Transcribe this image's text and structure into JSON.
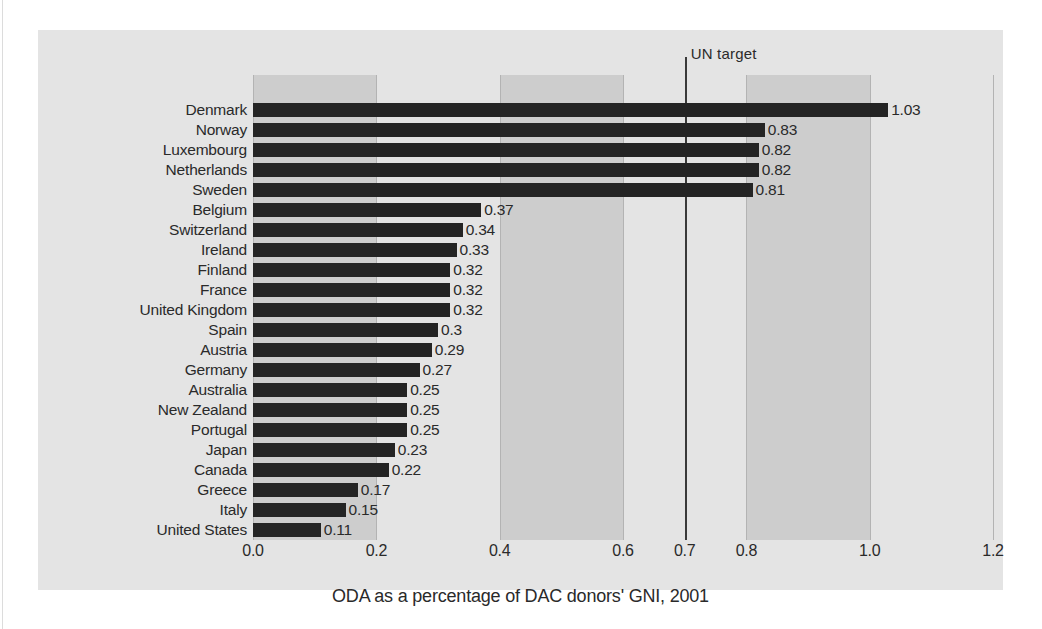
{
  "chart_data": {
    "type": "bar",
    "orientation": "horizontal",
    "title": "",
    "caption": "ODA as a percentage of DAC donors' GNI, 2001",
    "xlabel": "",
    "ylabel": "",
    "xlim": [
      0.0,
      1.2
    ],
    "xticks": [
      "0.0",
      "0.2",
      "0.4",
      "0.6",
      "0.7",
      "0.8",
      "1.0",
      "1.2"
    ],
    "xtick_values": [
      0.0,
      0.2,
      0.4,
      0.6,
      0.7,
      0.8,
      1.0,
      1.2
    ],
    "grid": "vertical-banded",
    "legend": "none",
    "shaded_bands": [
      [
        0.0,
        0.2
      ],
      [
        0.4,
        0.6
      ],
      [
        0.8,
        1.0
      ]
    ],
    "annotation": {
      "label": "UN target",
      "value": 0.7
    },
    "categories": [
      "Denmark",
      "Norway",
      "Luxembourg",
      "Netherlands",
      "Sweden",
      "Belgium",
      "Switzerland",
      "Ireland",
      "Finland",
      "France",
      "United Kingdom",
      "Spain",
      "Austria",
      "Germany",
      "Australia",
      "New Zealand",
      "Portugal",
      "Japan",
      "Canada",
      "Greece",
      "Italy",
      "United States"
    ],
    "values": [
      1.03,
      0.83,
      0.82,
      0.82,
      0.81,
      0.37,
      0.34,
      0.33,
      0.32,
      0.32,
      0.32,
      0.3,
      0.29,
      0.27,
      0.25,
      0.25,
      0.25,
      0.23,
      0.22,
      0.17,
      0.15,
      0.11
    ],
    "value_labels": [
      "1.03",
      "0.83",
      "0.82",
      "0.82",
      "0.81",
      "0.37",
      "0.34",
      "0.33",
      "0.32",
      "0.32",
      "0.32",
      "0.3",
      "0.29",
      "0.27",
      "0.25",
      "0.25",
      "0.25",
      "0.23",
      "0.22",
      "0.17",
      "0.15",
      "0.11"
    ],
    "colors": {
      "bar": "#242424",
      "panel_background": "#e4e4e4",
      "band": "#cdcdcd",
      "gridline": "#b3b3b3",
      "target_line": "#3a3a3a",
      "text": "#2a2a2a"
    }
  }
}
